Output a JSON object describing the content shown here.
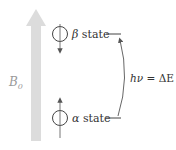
{
  "diagram": {
    "field": {
      "label": "B",
      "subscript": "0",
      "color": "#d9d9d9",
      "label_color": "#9a9a9a"
    },
    "states": [
      {
        "symbol": "β",
        "text": " state",
        "spin": "down"
      },
      {
        "symbol": "α",
        "text": " state",
        "spin": "up"
      }
    ],
    "transition": {
      "lhs": "hν",
      "eq": " = ",
      "rhs": "ΔE",
      "direction": "alpha-to-beta"
    },
    "colors": {
      "line": "#444444",
      "text": "#333333"
    }
  }
}
